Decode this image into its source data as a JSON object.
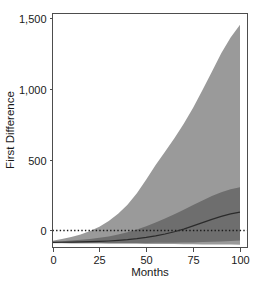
{
  "chart_data": {
    "type": "area",
    "title": "",
    "xlabel": "Months",
    "ylabel": "First Difference",
    "xlim": [
      0,
      104
    ],
    "ylim": [
      -120,
      1530
    ],
    "xticks": [
      0,
      25,
      50,
      75,
      100
    ],
    "xtick_labels": [
      "0",
      "25",
      "50",
      "75",
      "100"
    ],
    "yticks": [
      0,
      500,
      1000,
      1500
    ],
    "ytick_labels": [
      "0",
      "500",
      "1,000",
      "1,500"
    ],
    "grid": false,
    "legend": false,
    "reference_lines": [
      {
        "name": "zero-reference",
        "orientation": "horizontal",
        "value": 0,
        "style": "dotted",
        "color": "#1a1a1a"
      }
    ],
    "x": [
      0,
      5,
      10,
      15,
      20,
      25,
      30,
      35,
      40,
      45,
      50,
      55,
      60,
      65,
      70,
      75,
      80,
      85,
      90,
      95,
      100
    ],
    "series": [
      {
        "name": "outer-interval-upper",
        "role": "band-upper",
        "color": "#9a9a9a",
        "values": [
          -72,
          -60,
          -46,
          -28,
          -4,
          26,
          66,
          118,
          182,
          262,
          360,
          462,
          556,
          650,
          752,
          866,
          990,
          1120,
          1250,
          1360,
          1450
        ]
      },
      {
        "name": "outer-interval-lower",
        "role": "band-lower",
        "color": "#9a9a9a",
        "values": [
          -90,
          -90,
          -91,
          -91,
          -92,
          -92,
          -93,
          -93,
          -94,
          -94,
          -95,
          -95,
          -96,
          -96,
          -97,
          -97,
          -98,
          -98,
          -99,
          -99,
          -100
        ]
      },
      {
        "name": "inner-interval-upper",
        "role": "band-upper",
        "color": "#6e6e6e",
        "values": [
          -80,
          -76,
          -71,
          -66,
          -60,
          -52,
          -42,
          -29,
          -13,
          7,
          30,
          56,
          84,
          114,
          146,
          180,
          212,
          244,
          270,
          290,
          305
        ]
      },
      {
        "name": "inner-interval-lower",
        "role": "band-lower",
        "color": "#6e6e6e",
        "values": [
          -88,
          -88,
          -88,
          -88,
          -88,
          -88,
          -88,
          -88,
          -88,
          -88,
          -88,
          -87,
          -87,
          -86,
          -85,
          -84,
          -82,
          -80,
          -77,
          -74,
          -70
        ]
      },
      {
        "name": "median-estimate",
        "role": "line",
        "color": "#2b2b2b",
        "values": [
          -84,
          -83,
          -82,
          -81,
          -79,
          -77,
          -74,
          -70,
          -65,
          -58,
          -49,
          -38,
          -25,
          -9,
          10,
          32,
          55,
          78,
          99,
          117,
          130
        ]
      }
    ]
  },
  "axis": {
    "y_title": "First Difference",
    "x_title": "Months"
  }
}
